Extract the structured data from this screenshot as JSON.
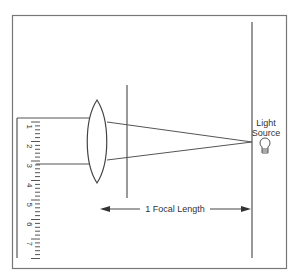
{
  "diagram": {
    "light_source_label_line1": "Light",
    "light_source_label_line2": "Source",
    "focal_length_label": "1 Focal Length",
    "ruler_numbers": [
      "1",
      "2",
      "3",
      "4",
      "5",
      "6",
      "7"
    ],
    "colors": {
      "line": "#555555",
      "frame": "#777777",
      "background": "#ffffff"
    }
  }
}
